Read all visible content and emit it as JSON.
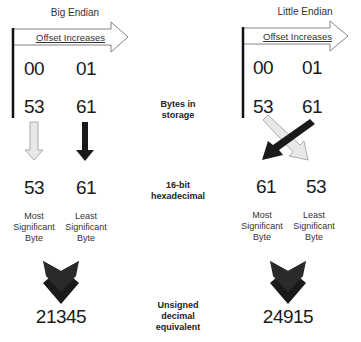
{
  "diagram": {
    "left": {
      "title": "Big Endian",
      "offset_label": "Offset Increases",
      "offsets": [
        "00",
        "01"
      ],
      "bytes": [
        "53",
        "61"
      ],
      "hex": [
        "53",
        "61"
      ],
      "significance": [
        {
          "line1": "Most",
          "line2": "Significant",
          "line3": "Byte"
        },
        {
          "line1": "Least",
          "line2": "Significant",
          "line3": "Byte"
        }
      ],
      "decimal": "21345"
    },
    "right": {
      "title": "Little Endian",
      "offset_label": "Offset Increases",
      "offsets": [
        "00",
        "01"
      ],
      "bytes": [
        "53",
        "61"
      ],
      "hex": [
        "61",
        "53"
      ],
      "significance": [
        {
          "line1": "Most",
          "line2": "Significant",
          "line3": "Byte"
        },
        {
          "line1": "Least",
          "line2": "Significant",
          "line3": "Byte"
        }
      ],
      "decimal": "24915"
    },
    "middle_labels": {
      "storage": {
        "line1": "Bytes in",
        "line2": "storage"
      },
      "hex": {
        "line1": "16-bit",
        "line2": "hexadecimal"
      },
      "decimal": {
        "line1": "Unsigned",
        "line2": "decimal",
        "line3": "equivalent"
      }
    },
    "colors": {
      "dark_arrow": "#1a1a1a",
      "light_arrow_fill": "#e8e8e8",
      "light_arrow_stroke": "#999999"
    }
  }
}
